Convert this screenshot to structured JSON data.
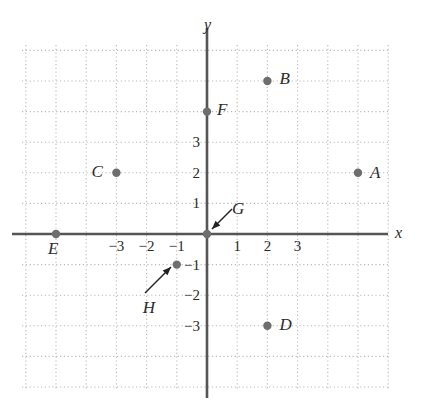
{
  "figure": {
    "title": "",
    "width": 426,
    "height": 410,
    "background": "#ffffff"
  },
  "colors": {
    "axis": "#555555",
    "grid": "#b9b9b9",
    "point": "#6e6e6e",
    "text": "#2b2b2b",
    "arrow": "#222222"
  },
  "axes": {
    "x_label": "x",
    "y_label": "y",
    "x_ticks": [
      {
        "value": -3,
        "label": "−3"
      },
      {
        "value": -2,
        "label": "−2"
      },
      {
        "value": -1,
        "label": "−1"
      },
      {
        "value": 1,
        "label": "1"
      },
      {
        "value": 2,
        "label": "2"
      },
      {
        "value": 3,
        "label": "3"
      }
    ],
    "y_ticks": [
      {
        "value": 3,
        "label": "3"
      },
      {
        "value": 2,
        "label": "2"
      },
      {
        "value": 1,
        "label": "1"
      },
      {
        "value": -1,
        "label": "−1"
      },
      {
        "value": -2,
        "label": "−2"
      },
      {
        "value": -3,
        "label": "−3"
      }
    ],
    "xlim": [
      -6.2,
      6.1
    ],
    "ylim": [
      -5.1,
      6.2
    ],
    "grid": true
  },
  "chart_data": {
    "type": "scatter",
    "title": "",
    "xlabel": "x",
    "ylabel": "y",
    "xlim": [
      -6.2,
      6.1
    ],
    "ylim": [
      -5.1,
      6.2
    ],
    "grid": true,
    "legend": "none",
    "points": [
      {
        "name": "A",
        "x": 5,
        "y": 2,
        "label": "A",
        "label_pos": "right"
      },
      {
        "name": "B",
        "x": 2,
        "y": 5,
        "label": "B",
        "label_pos": "right"
      },
      {
        "name": "C",
        "x": -3,
        "y": 2,
        "label": "C",
        "label_pos": "left"
      },
      {
        "name": "D",
        "x": 2,
        "y": -3,
        "label": "D",
        "label_pos": "right"
      },
      {
        "name": "E",
        "x": -5,
        "y": 0,
        "label": "E",
        "label_pos": "below-left"
      },
      {
        "name": "F",
        "x": 0,
        "y": 4,
        "label": "F",
        "label_pos": "right"
      },
      {
        "name": "G",
        "x": 0,
        "y": 0,
        "label": "G",
        "label_pos": "arrow-upper-right"
      },
      {
        "name": "H",
        "x": -1,
        "y": -1,
        "label": "H",
        "label_pos": "arrow-lower-left"
      }
    ],
    "annotations": [
      {
        "label": "G",
        "points_to": "G",
        "type": "leader-arrow"
      },
      {
        "label": "H",
        "points_to": "H",
        "type": "leader-arrow"
      }
    ]
  }
}
